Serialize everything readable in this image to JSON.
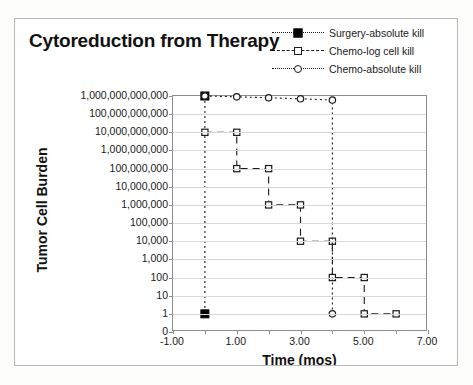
{
  "chart_data": {
    "type": "line",
    "title": "Cytoreduction from Therapy",
    "xlabel": "Time (mos)",
    "ylabel": "Tumor Cell Burden",
    "grid": true,
    "legend_position": "top-right",
    "yscale": "log-like-ordinal",
    "ylim": [
      0,
      1000000000000
    ],
    "xlim": [
      -1,
      7
    ],
    "xtick_step": 1,
    "ytick_labels": [
      "1,000,000,000,000",
      "100,000,000,000",
      "10,000,000,000",
      "1,000,000,000",
      "100,000,000",
      "10,000,000",
      "1,000,000",
      "100,000",
      "10,000",
      "1,000",
      "100",
      "10",
      "1",
      "0"
    ],
    "ytick_values": [
      1000000000000,
      100000000000,
      10000000000,
      1000000000,
      100000000,
      10000000,
      1000000,
      100000,
      10000,
      1000,
      100,
      10,
      1,
      0
    ],
    "xtick_labels": [
      "-1.00",
      "1.00",
      "3.00",
      "5.00",
      "7.00"
    ],
    "xtick_values": [
      -1,
      1,
      3,
      5,
      7
    ],
    "series": [
      {
        "name": "Surgery-absolute kill",
        "marker": "filled-square",
        "line": "dotted",
        "points": [
          {
            "x": 0,
            "y": 1000000000000
          },
          {
            "x": 0,
            "y": 1
          }
        ]
      },
      {
        "name": "Chemo-log cell kill",
        "marker": "open-square",
        "line": "dashed",
        "points": [
          {
            "x": 0,
            "y": 10000000000
          },
          {
            "x": 1,
            "y": 10000000000
          },
          {
            "x": 1,
            "y": 100000000
          },
          {
            "x": 2,
            "y": 100000000
          },
          {
            "x": 2,
            "y": 1000000
          },
          {
            "x": 3,
            "y": 1000000
          },
          {
            "x": 3,
            "y": 10000
          },
          {
            "x": 4,
            "y": 10000
          },
          {
            "x": 4,
            "y": 100
          },
          {
            "x": 5,
            "y": 100
          },
          {
            "x": 5,
            "y": 1
          },
          {
            "x": 6,
            "y": 1
          }
        ]
      },
      {
        "name": "Chemo-absolute kill",
        "marker": "open-circle",
        "line": "dotted",
        "points": [
          {
            "x": 0,
            "y": 1000000000000
          },
          {
            "x": 1,
            "y": 900000000000
          },
          {
            "x": 2,
            "y": 800000000000
          },
          {
            "x": 3,
            "y": 700000000000
          },
          {
            "x": 4,
            "y": 600000000000
          },
          {
            "x": 4,
            "y": 1
          }
        ]
      }
    ]
  },
  "legend": {
    "items": [
      {
        "label": "Surgery-absolute kill",
        "marker": "filled-square",
        "line": "dotted"
      },
      {
        "label": "Chemo-log cell kill",
        "marker": "open-square",
        "line": "dashed"
      },
      {
        "label": "Chemo-absolute kill",
        "marker": "open-circle",
        "line": "dotted"
      }
    ]
  }
}
